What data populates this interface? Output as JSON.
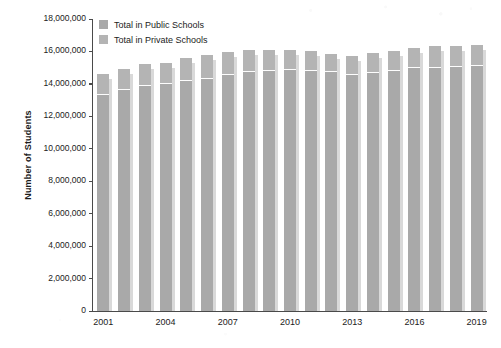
{
  "chart_data": {
    "type": "bar",
    "stacked": true,
    "title": "",
    "subtitle": "",
    "xlabel": "",
    "ylabel": "Number of Students",
    "ylim": [
      0,
      18000000
    ],
    "ytick_values": [
      0,
      2000000,
      4000000,
      6000000,
      8000000,
      10000000,
      12000000,
      14000000,
      16000000,
      18000000
    ],
    "ytick_labels": [
      "0",
      "2,000,000",
      "4,000,000",
      "6,000,000",
      "8,000,000",
      "10,000,000",
      "12,000,000",
      "14,000,000",
      "16,000,000",
      "18,000,000"
    ],
    "grid": false,
    "legend_position": "top-left",
    "categories": [
      "2001",
      "2002",
      "2003",
      "2004",
      "2005",
      "2006",
      "2007",
      "2008",
      "2009",
      "2010",
      "2011",
      "2012",
      "2013",
      "2014",
      "2015",
      "2016",
      "2017",
      "2018",
      "2019"
    ],
    "xtick_labels": [
      "2001",
      "2004",
      "2007",
      "2010",
      "2013",
      "2016",
      "2019"
    ],
    "series": [
      {
        "name": "Total in Public Schools",
        "color": "#a9a9a9",
        "values": [
          13300000,
          13600000,
          13850000,
          14000000,
          14200000,
          14300000,
          14550000,
          14750000,
          14800000,
          14850000,
          14800000,
          14750000,
          14550000,
          14700000,
          14800000,
          14950000,
          15000000,
          15050000,
          15100000
        ]
      },
      {
        "name": "Total in Private Schools",
        "color": "#b4b4b4",
        "values": [
          1250000,
          1250000,
          1300000,
          1250000,
          1350000,
          1450000,
          1350000,
          1300000,
          1250000,
          1200000,
          1150000,
          1050000,
          1100000,
          1150000,
          1150000,
          1200000,
          1250000,
          1250000,
          1250000
        ]
      }
    ],
    "totals": [
      14550000,
      14850000,
      15150000,
      15250000,
      15550000,
      15750000,
      15900000,
      16050000,
      16050000,
      16050000,
      15950000,
      15800000,
      15650000,
      15850000,
      15950000,
      16150000,
      16250000,
      16300000,
      16350000
    ]
  },
  "legend": {
    "items": [
      {
        "label": "Total in Public Schools",
        "color": "#a9a9a9"
      },
      {
        "label": "Total in Private Schools",
        "color": "#b4b4b4"
      }
    ]
  },
  "axes": {
    "y_title": "Number of Students"
  }
}
